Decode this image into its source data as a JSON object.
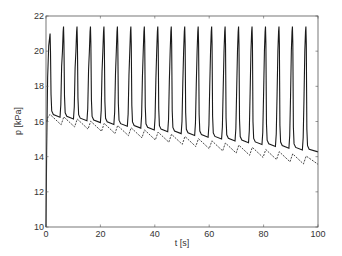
{
  "chart_data": {
    "type": "line",
    "title": "",
    "xlabel": "t [s]",
    "ylabel": "p [kPa]",
    "xlim": [
      0,
      100
    ],
    "ylim": [
      10,
      22
    ],
    "xticks": [
      0,
      20,
      40,
      60,
      80,
      100
    ],
    "yticks": [
      10,
      12,
      14,
      16,
      18,
      20,
      22
    ],
    "grid": false,
    "legend": null,
    "series": [
      {
        "name": "solid",
        "style": "solid",
        "color": "#1a1a1a",
        "description": "Pulsatile pressure: starts at 10 kPa at t=0, rises to first peak ~21.0 kPa at t~1.5 s, then 20 pulses with period ~5 s, peaks ~21.4 kPa, troughs decaying from ~16.4 to ~14.3 kPa",
        "start_value": 10,
        "period": 4.95,
        "first_peak_t": 1.5,
        "peak_count": 20,
        "peaks": [
          21.0,
          21.4,
          21.4,
          21.4,
          21.4,
          21.4,
          21.4,
          21.4,
          21.4,
          21.4,
          21.4,
          21.4,
          21.4,
          21.4,
          21.4,
          21.4,
          21.4,
          21.4,
          21.4,
          21.4
        ],
        "trough_start": 16.4,
        "trough_end": 14.3
      },
      {
        "name": "dashed",
        "style": "dashed",
        "color": "#333333",
        "description": "Baseline pressure: sawtooth decaying from ~16.3 kPa to ~13.7 kPa with ~0.4 kPa bumps at each pulse",
        "start_value": 16.2,
        "end_value": 13.7,
        "bump_amplitude": 0.45
      }
    ]
  },
  "axes": {
    "xlabel": "t [s]",
    "ylabel": "p [kPa]"
  }
}
